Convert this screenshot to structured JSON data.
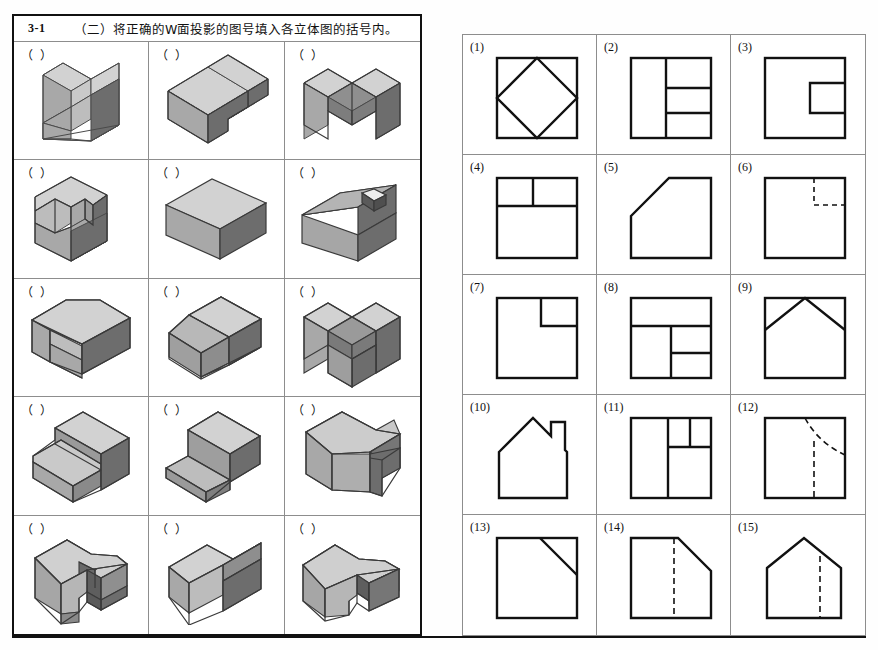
{
  "header": {
    "number": "3-1",
    "text": "（二）将正确的W面投影的图号填入各立体图的括号内。"
  },
  "answer_placeholder": "（  ）",
  "colors": {
    "face_top": "#d2d2d2",
    "face_left": "#a8a8a8",
    "face_right": "#6d6d6d",
    "face_inner": "#8f8f8f",
    "outline": "#111111",
    "grid_line": "#8d8d8d",
    "border": "#111111",
    "background": "#ffffff"
  },
  "left_panel": {
    "rows": 5,
    "cols": 3,
    "cells": [
      {
        "id": "solid-1",
        "answer": "（  ）",
        "description": "rectangular block with a square notch cut into the middle of the front-right face"
      },
      {
        "id": "solid-2",
        "answer": "（  ）",
        "description": "cube with a rectangular step notch cut from the top-front-right corner"
      },
      {
        "id": "solid-3",
        "answer": "（  ）",
        "description": "block with a wide U-shaped channel cut through the top centre"
      },
      {
        "id": "solid-4",
        "answer": "（  ）",
        "description": "block with an angled chamfer on the left face and a step on the top-right"
      },
      {
        "id": "solid-5",
        "answer": "（  ）",
        "description": "plain rectangular box, no cuts"
      },
      {
        "id": "solid-6",
        "answer": "（  ）",
        "description": "house-shaped prism with a sloped roof and a small rectangular chimney hole"
      },
      {
        "id": "solid-7",
        "answer": "（  ）",
        "description": "L-shaped block, lower step across the front-left side"
      },
      {
        "id": "solid-8",
        "answer": "（  ）",
        "description": "cube with an inclined planar cut across the front-left corner"
      },
      {
        "id": "solid-9",
        "answer": "（  ）",
        "description": "block with a deep rectangular slot cut through the centre leaving two legs"
      },
      {
        "id": "solid-10",
        "answer": "（  ）",
        "description": "T-shaped block, tall rear slab with a lower wide front platform"
      },
      {
        "id": "solid-11",
        "answer": "（  ）",
        "description": "cube with a large inclined wedge plane sloping down to the front-left"
      },
      {
        "id": "solid-12",
        "answer": "（  ）",
        "description": "block with a narrow angled slot cut into the right face"
      },
      {
        "id": "solid-13",
        "answer": "（  ）",
        "description": "house-shaped block with a sloped roof and a vertical slot cut in the front"
      },
      {
        "id": "solid-14",
        "answer": "（  ）",
        "description": "block with a large rectangular notch cut from the top-right"
      },
      {
        "id": "solid-15",
        "answer": "（  ）",
        "description": "sloped-roof block with a narrow vertical slot cut through the right end"
      }
    ]
  },
  "right_panel": {
    "rows": 5,
    "cols": 3,
    "views": [
      {
        "label": "(1)",
        "id": "view-1",
        "description": "square with an inscribed diamond (rotated square) touching all four midpoints"
      },
      {
        "label": "(2)",
        "id": "view-2",
        "description": "square split by a vertical line; right portion divided into three horizontal bands"
      },
      {
        "label": "(3)",
        "id": "view-3",
        "description": "square with two rectangles notched into the right edge forming an H / C shape"
      },
      {
        "label": "(4)",
        "id": "view-4",
        "description": "square with a horizontal band across the top divided by a short vertical line"
      },
      {
        "label": "(5)",
        "id": "view-5",
        "description": "square with the top-left corner cut off by a long 45° chamfer"
      },
      {
        "label": "(6)",
        "id": "view-6",
        "description": "plain square with dashed hidden lines forming a small rectangle at the top-right"
      },
      {
        "label": "(7)",
        "id": "view-7",
        "description": "square with a small rectangle notched into the top-right corner"
      },
      {
        "label": "(8)",
        "id": "view-8",
        "description": "square with a top band, then the lower area split into left block and two right cells"
      },
      {
        "label": "(9)",
        "id": "view-9",
        "description": "square with an inverted V (gable) line from the left edge to the apex to the right edge"
      },
      {
        "label": "(10)",
        "id": "view-10",
        "description": "house outline with pitched roof and a small chimney on the right slope"
      },
      {
        "label": "(11)",
        "id": "view-11",
        "description": "square divided vertically; upper right split into two small cells"
      },
      {
        "label": "(12)",
        "id": "view-12",
        "description": "square with a dashed curve/diagonal from the top edge and a dashed vertical line"
      },
      {
        "label": "(13)",
        "id": "view-13",
        "description": "square with a solid diagonal line from the top edge down to the right edge"
      },
      {
        "label": "(14)",
        "id": "view-14",
        "description": "square with the top-right corner chamfered and a dashed vertical hidden line"
      },
      {
        "label": "(15)",
        "id": "view-15",
        "description": "pentagon house outline with pitched roof and a dashed vertical hidden line"
      }
    ]
  }
}
